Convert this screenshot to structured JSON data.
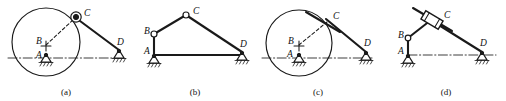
{
  "figure": {
    "background": "#ffffff",
    "ink": "#1a1a1a",
    "width": 506,
    "height": 101
  },
  "panels": [
    {
      "key": "a",
      "caption": "(a)",
      "description": "Eccentric cam/disc with pin joint at C on the rim, frame link A-D",
      "joint_c_type": "pin-in-ring",
      "labels": {
        "A": "A",
        "B": "B",
        "C": "C",
        "D": "D"
      },
      "points": {
        "A": [
          46,
          58
        ],
        "B": [
          46,
          45
        ],
        "C": [
          76,
          17
        ],
        "D": [
          119,
          50
        ]
      },
      "circle": {
        "cx": 46,
        "cy": 42,
        "r": 34
      }
    },
    {
      "key": "b",
      "caption": "(b)",
      "description": "Four-bar linkage A-B-C-D with revolute joints at B and C",
      "joint_c_type": "pin",
      "labels": {
        "A": "A",
        "B": "B",
        "C": "C",
        "D": "D"
      },
      "points": {
        "A": [
          22,
          55
        ],
        "B": [
          22,
          34
        ],
        "C": [
          54,
          15
        ],
        "D": [
          110,
          52
        ]
      }
    },
    {
      "key": "c",
      "caption": "(c)",
      "description": "Disc with tangential slide line contacting link at C, frame A-D",
      "joint_c_type": "tangent-line-contact",
      "labels": {
        "A": "A",
        "B": "B",
        "C": "C",
        "D": "D"
      },
      "points": {
        "A": [
          45,
          58
        ],
        "B": [
          45,
          45
        ],
        "C": [
          75,
          21
        ],
        "D": [
          112,
          52
        ]
      },
      "circle": {
        "cx": 45,
        "cy": 43,
        "r": 33
      }
    },
    {
      "key": "d",
      "caption": "(d)",
      "description": "Slider block on inclined guide at C, crank A-B, link to D",
      "joint_c_type": "slider-block",
      "labels": {
        "A": "A",
        "B": "B",
        "C": "C",
        "D": "D"
      },
      "points": {
        "A": [
          26,
          55
        ],
        "B": [
          26,
          38
        ],
        "C": [
          50,
          19
        ],
        "D": [
          100,
          52
        ]
      }
    }
  ]
}
